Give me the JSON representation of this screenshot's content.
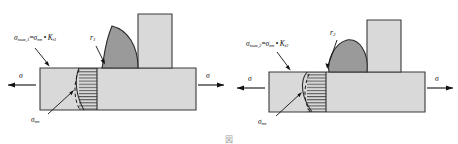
{
  "figure": {
    "type": "engineering-diagram",
    "caption": "図",
    "panel_count": 2,
    "colors": {
      "plate_fill": "#d9d9d9",
      "plate_stroke": "#3a3a3a",
      "weld_fill": "#9a9a9a",
      "weld_stroke": "#2b2b2b",
      "hatch_stroke": "#2b2b2b",
      "dashed_stroke": "#1a1a1a",
      "leader_stroke": "#111111",
      "background": "#ffffff"
    }
  },
  "panels": [
    {
      "id": "left",
      "name": "low-stress-concentration-joint",
      "stress_peak_label": {
        "sigma": "σ",
        "sub_max": "max,1",
        "equals": "=",
        "sigma_nom": "σ",
        "sub_nom": "nn",
        "dot": "•",
        "kt": "K",
        "sub_kt": "t1"
      },
      "notch_radius_label": {
        "symbol": "r",
        "subscript": "1"
      },
      "nominal_stress_label": {
        "symbol": "σ",
        "subscript": "nn"
      },
      "load_left": "σ",
      "load_right": "σ"
    },
    {
      "id": "right",
      "name": "high-stress-concentration-joint",
      "stress_peak_label": {
        "sigma": "σ",
        "sub_max": "max,2",
        "equals": "=",
        "sigma_nom": "σ",
        "sub_nom": "nn",
        "dot": "•",
        "kt": "K",
        "sub_kt": "t2"
      },
      "notch_radius_label": {
        "symbol": "r",
        "subscript": "2"
      },
      "nominal_stress_label": {
        "symbol": "σ",
        "subscript": "nn"
      },
      "load_left": "σ",
      "load_right": "σ"
    }
  ]
}
